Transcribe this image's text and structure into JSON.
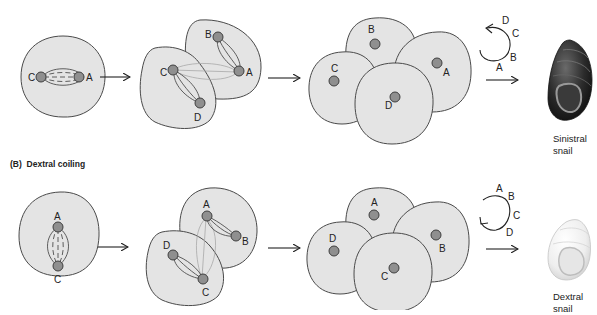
{
  "panels": [
    {
      "id": "sinistral",
      "heading": "",
      "stage1": {
        "labels": [
          "C",
          "A"
        ]
      },
      "stage2": {
        "labels": [
          "B",
          "C",
          "A",
          "D"
        ]
      },
      "stage3": {
        "labels": [
          "B",
          "C",
          "A",
          "D"
        ]
      },
      "rotation": {
        "direction": "counterclockwise",
        "labels": [
          "D",
          "C",
          "B",
          "A"
        ]
      },
      "result": {
        "caption_line1": "Sinistral",
        "caption_line2": "snail"
      }
    },
    {
      "id": "dextral",
      "heading_prefix": "(B)",
      "heading": "Dextral coiling",
      "stage1": {
        "labels": [
          "A",
          "C"
        ]
      },
      "stage2": {
        "labels": [
          "A",
          "B",
          "D",
          "C"
        ]
      },
      "stage3": {
        "labels": [
          "A",
          "D",
          "B",
          "C"
        ]
      },
      "rotation": {
        "direction": "clockwise",
        "labels": [
          "A",
          "B",
          "C",
          "D"
        ]
      },
      "result": {
        "caption_line1": "Dextral",
        "caption_line2": "snail"
      }
    }
  ],
  "colors": {
    "cell_fill": "#e4e4e4",
    "nucleus_fill": "#8f8f8f",
    "outline": "#4a4a4a",
    "sinistral_shell": "#2e2e2e",
    "dextral_shell": "#f0f0f0"
  }
}
